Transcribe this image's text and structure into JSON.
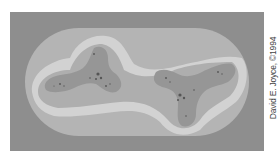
{
  "image": {
    "description": "Grayscale fractal rendering: an elongated oval containing two three-lobed (tripod-shaped) fractal blobs with fine detail at their centers",
    "colors": {
      "background": "#8e8e8e",
      "outer_oval": "#b4b4b4",
      "light_band": "#d2d2d2",
      "middle_band": "#aeaeae",
      "inner_blob": "#969696",
      "detail": "#555555"
    }
  },
  "credit": {
    "text": "David E. Joyce, ©1994"
  }
}
